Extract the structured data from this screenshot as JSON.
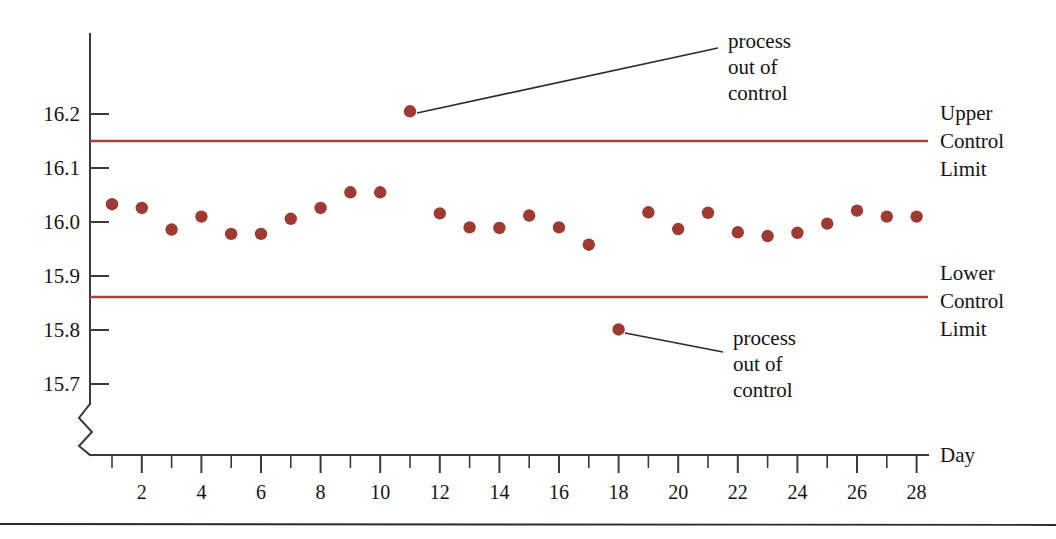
{
  "chart_data": {
    "type": "scatter",
    "title": "",
    "xlabel": "Day",
    "ylabel": "",
    "x": [
      1,
      2,
      3,
      4,
      5,
      6,
      7,
      8,
      9,
      10,
      11,
      12,
      13,
      14,
      15,
      16,
      17,
      18,
      19,
      20,
      21,
      22,
      23,
      24,
      25,
      26,
      27,
      28
    ],
    "values": [
      16.033,
      16.026,
      15.986,
      16.01,
      15.978,
      15.978,
      16.006,
      16.026,
      16.055,
      16.055,
      16.205,
      16.016,
      15.99,
      15.989,
      16.012,
      15.99,
      15.958,
      15.801,
      16.018,
      15.987,
      16.017,
      15.981,
      15.974,
      15.98,
      15.997,
      16.021,
      16.01,
      16.01
    ],
    "series": [
      {
        "name": "daily measurement",
        "values": [
          16.033,
          16.026,
          15.986,
          16.01,
          15.978,
          15.978,
          16.006,
          16.026,
          16.055,
          16.055,
          16.205,
          16.016,
          15.99,
          15.989,
          16.012,
          15.99,
          15.958,
          15.801,
          16.018,
          15.987,
          16.017,
          15.981,
          15.974,
          15.98,
          15.997,
          16.021,
          16.01,
          16.01
        ]
      }
    ],
    "ylim": [
      15.655,
      16.255
    ],
    "xlim": [
      0.4,
      28.6
    ],
    "y_ticks": [
      16.2,
      16.1,
      16.0,
      15.9,
      15.8,
      15.7
    ],
    "y_tick_labels": [
      "16.2",
      "16.1",
      "16.0",
      "15.9",
      "15.8",
      "15.7"
    ],
    "x_ticks": [
      1,
      2,
      3,
      4,
      5,
      6,
      7,
      8,
      9,
      10,
      11,
      12,
      13,
      14,
      15,
      16,
      17,
      18,
      19,
      20,
      21,
      22,
      23,
      24,
      25,
      26,
      27,
      28
    ],
    "x_tick_labels": [
      "",
      "2",
      "",
      "4",
      "",
      "6",
      "",
      "8",
      "",
      "10",
      "",
      "12",
      "",
      "14",
      "",
      "16",
      "",
      "18",
      "",
      "20",
      "",
      "22",
      "",
      "24",
      "",
      "26",
      "",
      "28"
    ],
    "grid": false,
    "legend": "none",
    "axis_break": true,
    "control_limits": [
      {
        "name": "upper_control_limit",
        "label": "Upper\nControl\nLimit",
        "value": 16.15
      },
      {
        "name": "lower_control_limit",
        "label": "Lower\nControl\nLimit",
        "value": 15.861
      }
    ],
    "out_of_control_points": [
      {
        "day": 11,
        "value": 16.205,
        "annotation": "process out of control"
      },
      {
        "day": 18,
        "value": 15.801,
        "annotation": "process out of control"
      }
    ]
  },
  "axis": {
    "y_tick_labels": [
      "16.2",
      "16.1",
      "16.0",
      "15.9",
      "15.8",
      "15.7"
    ],
    "x_tick_labels": [
      "2",
      "4",
      "6",
      "8",
      "10",
      "12",
      "14",
      "16",
      "18",
      "20",
      "22",
      "24",
      "26",
      "28"
    ],
    "x_axis_title": "Day"
  },
  "limits": {
    "upper": {
      "line1": "Upper",
      "line2": "Control",
      "line3": "Limit"
    },
    "lower": {
      "line1": "Lower",
      "line2": "Control",
      "line3": "Limit"
    }
  },
  "annotations": {
    "top": {
      "line1": "process",
      "line2": "out of",
      "line3": "control"
    },
    "bottom": {
      "line1": "process",
      "line2": "out of",
      "line3": "control"
    }
  },
  "colors": {
    "dot": "#9d3b32",
    "control_line": "#a4453b",
    "axis": "#3a3a3a",
    "text": "#141414"
  }
}
